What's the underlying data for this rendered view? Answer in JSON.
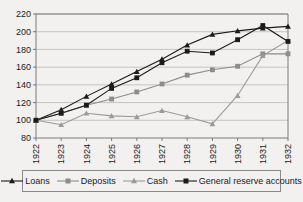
{
  "chart_data": {
    "type": "line",
    "title": "",
    "subtitle": "",
    "xlabel": "",
    "ylabel": "",
    "categories": [
      "1922",
      "1923",
      "1924",
      "1925",
      "1926",
      "1927",
      "1928",
      "1929",
      "1930",
      "1931",
      "1932"
    ],
    "x": [
      1922,
      1923,
      1924,
      1925,
      1926,
      1927,
      1928,
      1929,
      1930,
      1931,
      1932
    ],
    "ylim": [
      80,
      220
    ],
    "yticks": [
      80,
      100,
      120,
      140,
      160,
      180,
      200,
      220
    ],
    "ytick_labels": [
      "80",
      "100",
      "120",
      "140",
      "160",
      "180",
      "200",
      "220"
    ],
    "grid": true,
    "grid_axis": "y",
    "legend_position": "bottom",
    "series": [
      {
        "name": "Loans",
        "marker": "triangle",
        "color": "#1a1a1a",
        "values": [
          100,
          112,
          127,
          141,
          155,
          169,
          185,
          197,
          201,
          204,
          206
        ]
      },
      {
        "name": "Deposits",
        "marker": "square",
        "color": "#8c8c8c",
        "values": [
          100,
          108,
          117,
          124,
          132,
          141,
          151,
          157,
          161,
          175,
          175
        ]
      },
      {
        "name": "Cash",
        "marker": "triangle",
        "color": "#9a9a9a",
        "values": [
          100,
          95,
          108,
          105,
          104,
          111,
          104,
          96,
          128,
          173,
          190
        ]
      },
      {
        "name": "General reserve accounts",
        "marker": "square",
        "color": "#1a1a1a",
        "values": [
          100,
          108,
          117,
          136,
          148,
          165,
          178,
          176,
          191,
          207,
          189
        ]
      }
    ]
  },
  "legend": {
    "items": [
      {
        "label": "Loans"
      },
      {
        "label": "Deposits"
      },
      {
        "label": "Cash"
      },
      {
        "label": "General reserve accounts"
      }
    ]
  },
  "colors": {
    "background": "#f2f1ef",
    "axis": "#6e6e6e",
    "grid": "#b9b9b9",
    "dark_series": "#1a1a1a",
    "gray_series": "#8c8c8c",
    "light_gray_series": "#9a9a9a"
  }
}
